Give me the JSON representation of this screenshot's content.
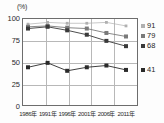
{
  "chart_data": {
    "type": "line",
    "title": "",
    "xlabel": "",
    "ylabel": "",
    "unit_label": "(%)",
    "categories": [
      "1986年",
      "1991年",
      "1996年",
      "2001年",
      "2006年",
      "2011年"
    ],
    "ylim": [
      0,
      100
    ],
    "yticks": [
      0,
      25,
      50,
      75,
      100
    ],
    "grid": true,
    "legend_position": "right-end-labels",
    "series": [
      {
        "name": "91",
        "end_value": "91",
        "color": "#b0b0b0",
        "marker": "square-small",
        "values": [
          93,
          95,
          94,
          94,
          95,
          91
        ]
      },
      {
        "name": "79",
        "end_value": "79",
        "color": "#7a7a7a",
        "marker": "square",
        "values": [
          90,
          91,
          89,
          88,
          83,
          79
        ]
      },
      {
        "name": "68",
        "end_value": "68",
        "color": "#3a3a3a",
        "marker": "square",
        "values": [
          88,
          90,
          86,
          81,
          74,
          68
        ]
      },
      {
        "name": "41",
        "end_value": "41",
        "color": "#2a2a2a",
        "marker": "square",
        "values": [
          44,
          49,
          40,
          44,
          46,
          41
        ]
      }
    ]
  },
  "axis": {
    "y_tick_labels": [
      "100",
      "75",
      "50",
      "25",
      "0"
    ],
    "x_tick_labels": [
      "1986年",
      "1991年",
      "1996年",
      "2001年",
      "2006年",
      "2011年"
    ]
  }
}
